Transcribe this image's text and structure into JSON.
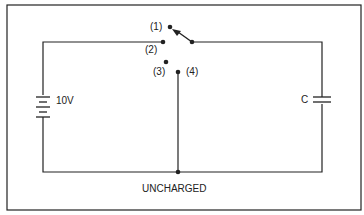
{
  "diagram": {
    "type": "circuit",
    "battery": {
      "label": "10V"
    },
    "capacitor": {
      "label": "C"
    },
    "switch": {
      "positions": [
        {
          "label": "(1)"
        },
        {
          "label": "(2)"
        },
        {
          "label": "(3)"
        },
        {
          "label": "(4)"
        }
      ]
    },
    "state_label": "UNCHARGED",
    "colors": {
      "line": "#222222",
      "background": "#ffffff"
    }
  }
}
